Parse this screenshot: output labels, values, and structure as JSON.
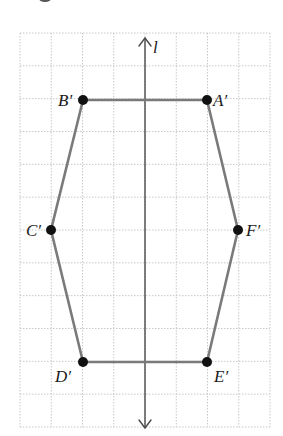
{
  "figure": {
    "grid": {
      "left": 20,
      "top": 33,
      "right": 270,
      "bottom": 427,
      "cols": 8,
      "rows": 12,
      "line_color": "#c8c8c8"
    },
    "axis": {
      "label": "l",
      "x": 145,
      "y_top": 38,
      "y_bottom": 428
    },
    "polygon": {
      "edge_color": "#7a7a7a",
      "vertices": [
        {
          "name": "A′",
          "x": 207,
          "y": 100,
          "label_x": 213,
          "label_y": 106
        },
        {
          "name": "B′",
          "x": 83,
          "y": 100,
          "label_x": 58,
          "label_y": 106
        },
        {
          "name": "C′",
          "x": 51,
          "y": 230,
          "label_x": 26,
          "label_y": 236
        },
        {
          "name": "D′",
          "x": 83,
          "y": 362,
          "label_x": 55,
          "label_y": 382
        },
        {
          "name": "E′",
          "x": 207,
          "y": 362,
          "label_x": 214,
          "label_y": 382
        },
        {
          "name": "F′",
          "x": 238,
          "y": 230,
          "label_x": 246,
          "label_y": 236
        }
      ]
    }
  }
}
